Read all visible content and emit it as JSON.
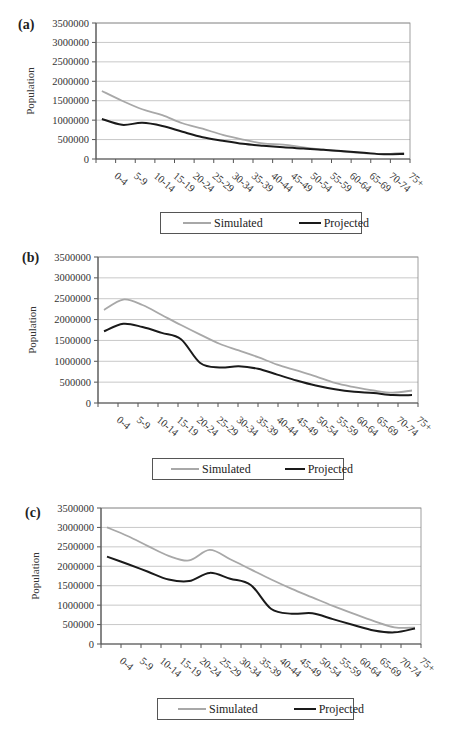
{
  "chart_data": [
    {
      "panel": "(a)",
      "type": "line",
      "title": "",
      "xlabel": "Age",
      "ylabel": "Population",
      "ylim": [
        0,
        3500000
      ],
      "yticks": [
        0,
        500000,
        1000000,
        1500000,
        2000000,
        2500000,
        3000000,
        3500000
      ],
      "grid": true,
      "legend_position": "bottom",
      "categories": [
        "0-4",
        "5-9",
        "10-14",
        "15-19",
        "20-24",
        "25-29",
        "30-34",
        "35-39",
        "40-44",
        "45-49",
        "50-54",
        "55-59",
        "60-64",
        "65-69",
        "70-74",
        "75+"
      ],
      "series": [
        {
          "name": "Simulated",
          "color": "#a8a8a8",
          "values": [
            1750000,
            1500000,
            1280000,
            1130000,
            920000,
            780000,
            620000,
            500000,
            400000,
            370000,
            300000,
            240000,
            190000,
            150000,
            130000,
            160000
          ]
        },
        {
          "name": "Projected",
          "color": "#1a1a1a",
          "values": [
            1030000,
            880000,
            930000,
            850000,
            700000,
            560000,
            470000,
            390000,
            340000,
            300000,
            270000,
            240000,
            200000,
            160000,
            120000,
            130000
          ]
        }
      ]
    },
    {
      "panel": "(b)",
      "type": "line",
      "title": "",
      "xlabel": "Age",
      "ylabel": "Population",
      "ylim": [
        0,
        3500000
      ],
      "yticks": [
        0,
        500000,
        1000000,
        1500000,
        2000000,
        2500000,
        3000000,
        3500000
      ],
      "grid": true,
      "legend_position": "bottom",
      "categories": [
        "0-4",
        "5-9",
        "10-14",
        "15-19",
        "20-24",
        "25-29",
        "30-34",
        "35-39",
        "40-44",
        "45-49",
        "50-54",
        "55-59",
        "60-64",
        "65-69",
        "70-74",
        "75+"
      ],
      "series": [
        {
          "name": "Simulated",
          "color": "#a8a8a8",
          "values": [
            2230000,
            2480000,
            2350000,
            2110000,
            1870000,
            1640000,
            1420000,
            1260000,
            1100000,
            920000,
            780000,
            640000,
            480000,
            380000,
            300000,
            250000,
            300000
          ]
        },
        {
          "name": "Projected",
          "color": "#1a1a1a",
          "values": [
            1720000,
            1900000,
            1820000,
            1680000,
            1530000,
            960000,
            850000,
            880000,
            820000,
            680000,
            540000,
            420000,
            330000,
            270000,
            240000,
            190000,
            190000
          ]
        }
      ]
    },
    {
      "panel": "(c)",
      "type": "line",
      "title": "",
      "xlabel": "Age",
      "ylabel": "Population",
      "ylim": [
        0,
        3500000
      ],
      "yticks": [
        0,
        500000,
        1000000,
        1500000,
        2000000,
        2500000,
        3000000,
        3500000
      ],
      "grid": true,
      "legend_position": "bottom",
      "categories": [
        "0-4",
        "5-9",
        "10-14",
        "15-19",
        "20-24",
        "25-29",
        "30-34",
        "35-39",
        "40-44",
        "45-49",
        "50-54",
        "55-59",
        "60-64",
        "65-69",
        "70-74",
        "75+"
      ],
      "series": [
        {
          "name": "Simulated",
          "color": "#a8a8a8",
          "values": [
            3000000,
            2780000,
            2520000,
            2270000,
            2150000,
            2420000,
            2180000,
            1920000,
            1660000,
            1420000,
            1200000,
            980000,
            780000,
            590000,
            430000,
            420000
          ]
        },
        {
          "name": "Projected",
          "color": "#1a1a1a",
          "values": [
            2250000,
            2060000,
            1860000,
            1660000,
            1620000,
            1830000,
            1680000,
            1520000,
            900000,
            780000,
            790000,
            640000,
            490000,
            350000,
            300000,
            400000
          ]
        }
      ]
    }
  ],
  "panels": [
    {
      "label": "(a)"
    },
    {
      "label": "(b)"
    },
    {
      "label": "(c)"
    }
  ],
  "axis": {
    "ylabel": "Population",
    "xlabel": "Age",
    "ytick_labels": [
      "0",
      "500000",
      "1000000",
      "1500000",
      "2000000",
      "2500000",
      "3000000",
      "3500000"
    ],
    "xtick_labels": [
      "0-4",
      "5-9",
      "10-14",
      "15-19",
      "20-24",
      "25-29",
      "30-34",
      "35-39",
      "40-44",
      "45-49",
      "50-54",
      "55-59",
      "60-64",
      "65-69",
      "70-74",
      "75+"
    ]
  },
  "legend": {
    "simulated": "Simulated",
    "projected": "Projected"
  },
  "colors": {
    "simulated": "#a8a8a8",
    "projected": "#1a1a1a",
    "grid": "#c8c8c8",
    "axis": "#555555"
  }
}
